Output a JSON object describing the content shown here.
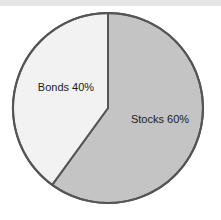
{
  "chart_data": {
    "type": "pie",
    "title": "",
    "subtitle": "",
    "xlabel": "",
    "ylabel": "",
    "legend": "none",
    "grid": false,
    "start_angle_deg": 0,
    "direction": "clockwise",
    "categories": [
      "Stocks",
      "Bonds"
    ],
    "values": [
      60,
      40
    ],
    "unit": "%",
    "slices": [
      {
        "name": "Stocks",
        "value": 60,
        "label": "Stocks 60%",
        "color": "#c4c4c4",
        "sweep_deg": 216,
        "start_deg": 0,
        "end_deg": 216,
        "label_x": 160,
        "label_y": 120
      },
      {
        "name": "Bonds",
        "value": 40,
        "label": "Bonds 40%",
        "color": "#f2f2f2",
        "sweep_deg": 144,
        "start_deg": 216,
        "end_deg": 360,
        "label_x": 66,
        "label_y": 88
      }
    ],
    "geometry": {
      "center_x": 108,
      "center_y": 108,
      "radius": 95
    },
    "style": {
      "outline_color": "#555555",
      "outline_width": 2,
      "background": "#ffffff",
      "scan_band_color": "#e6e6e6",
      "label_color": "#1c1c1c"
    }
  }
}
